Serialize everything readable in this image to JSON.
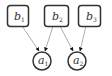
{
  "diagram": {
    "type": "bayesian-network",
    "nodes": [
      {
        "id": "b1",
        "base": "b",
        "sub": "1",
        "shape": "rounded-rect",
        "x": 7,
        "y": 5,
        "w": 21,
        "h": 21
      },
      {
        "id": "b2",
        "base": "b",
        "sub": "2",
        "shape": "rounded-rect",
        "x": 44,
        "y": 5,
        "w": 24,
        "h": 21
      },
      {
        "id": "b3",
        "base": "b",
        "sub": "3",
        "shape": "rounded-rect",
        "x": 78,
        "y": 5,
        "w": 22,
        "h": 21
      },
      {
        "id": "a1",
        "base": "a",
        "sub": "1",
        "shape": "circle",
        "cx": 42,
        "cy": 61,
        "r": 9
      },
      {
        "id": "a2",
        "base": "a",
        "sub": "2",
        "shape": "circle",
        "cx": 77,
        "cy": 61,
        "r": 9
      }
    ],
    "edges": [
      {
        "from": "b1",
        "to": "a1"
      },
      {
        "from": "b2",
        "to": "a1"
      },
      {
        "from": "b2",
        "to": "a2"
      },
      {
        "from": "b3",
        "to": "a2"
      }
    ],
    "colors": {
      "stroke": "#333333",
      "edge": "#999999",
      "arrowhead": "#111111"
    }
  }
}
